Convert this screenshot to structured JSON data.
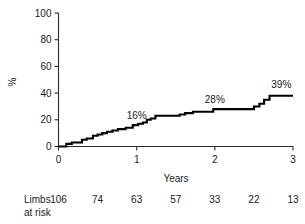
{
  "chart_data": {
    "type": "line",
    "subtype": "kaplan-meier-step",
    "title": "",
    "xlabel": "Years",
    "ylabel": "%",
    "xlim": [
      0,
      3
    ],
    "ylim": [
      0,
      100
    ],
    "xticks": [
      0,
      1,
      2,
      3
    ],
    "xtick_labels": [
      "0",
      "1",
      "2",
      "3"
    ],
    "yticks": [
      0,
      20,
      40,
      60,
      80,
      100
    ],
    "ytick_labels": [
      "0",
      "20",
      "40",
      "60",
      "80",
      "100"
    ],
    "grid": false,
    "legend": null,
    "series": [
      {
        "name": "Cumulative event rate",
        "color": "#000000",
        "step": "post",
        "x": [
          0.0,
          0.1,
          0.1,
          0.17,
          0.17,
          0.3,
          0.3,
          0.36,
          0.36,
          0.44,
          0.44,
          0.5,
          0.5,
          0.56,
          0.56,
          0.62,
          0.62,
          0.69,
          0.69,
          0.76,
          0.76,
          0.86,
          0.86,
          0.95,
          0.95,
          1.02,
          1.02,
          1.08,
          1.08,
          1.13,
          1.13,
          1.18,
          1.18,
          1.24,
          1.24,
          1.55,
          1.55,
          1.62,
          1.62,
          1.72,
          1.72,
          1.98,
          1.98,
          2.5,
          2.5,
          2.57,
          2.57,
          2.63,
          2.63,
          2.7,
          2.7,
          3.0
        ],
        "y": [
          0,
          0,
          2,
          2,
          3,
          3,
          5,
          5,
          6,
          6,
          8,
          8,
          9,
          9,
          10,
          10,
          11,
          11,
          12,
          12,
          13,
          13,
          14,
          14,
          16,
          16,
          17,
          17,
          18,
          18,
          20,
          20,
          21,
          21,
          23,
          23,
          24,
          24,
          25,
          25,
          26,
          26,
          28,
          28,
          30,
          30,
          32,
          32,
          35,
          35,
          38,
          38
        ]
      }
    ],
    "annotations": [
      {
        "text": "16%",
        "x": 1.0,
        "y": 16,
        "value": 16
      },
      {
        "text": "28%",
        "x": 2.0,
        "y": 28,
        "value": 28
      },
      {
        "text": "39%",
        "x": 2.85,
        "y": 39,
        "value": 39
      }
    ]
  },
  "risk_table": {
    "label_line1": "Limbs",
    "label_line2": "at risk",
    "times": [
      0,
      0.5,
      1,
      1.5,
      2,
      2.5,
      3
    ],
    "values": [
      "106",
      "74",
      "63",
      "57",
      "33",
      "22",
      "13"
    ]
  },
  "colors": {
    "curve": "#000000",
    "axis": "#2b2b2b",
    "text": "#1a1a1a",
    "background": "#ffffff"
  }
}
